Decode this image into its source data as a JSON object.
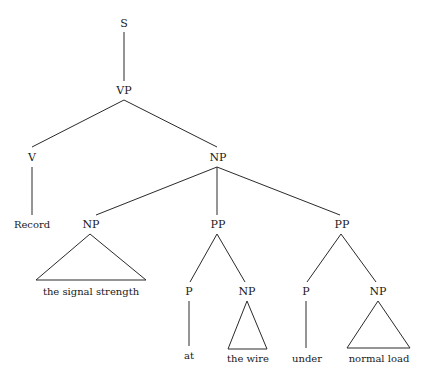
{
  "diagram": {
    "type": "parse-tree",
    "nodes": {
      "s": "S",
      "vp": "VP",
      "v": "V",
      "np_obj": "NP",
      "np_1": "NP",
      "pp_1": "PP",
      "pp_2": "PP",
      "p_1": "P",
      "np_2": "NP",
      "p_2": "P",
      "np_3": "NP"
    },
    "leaves": {
      "record": "Record",
      "signal_strength": "the signal strength",
      "at": "at",
      "the_wire": "the wire",
      "under": "under",
      "normal_load": "normal load"
    },
    "edges": [
      [
        "S",
        "VP"
      ],
      [
        "VP",
        "V"
      ],
      [
        "VP",
        "NP"
      ],
      [
        "V",
        "Record"
      ],
      [
        "NP",
        "NP"
      ],
      [
        "NP",
        "PP"
      ],
      [
        "NP",
        "PP"
      ],
      [
        "NP",
        "the signal strength (triangle)"
      ],
      [
        "PP",
        "P"
      ],
      [
        "PP",
        "NP"
      ],
      [
        "P",
        "at"
      ],
      [
        "NP",
        "the wire (triangle)"
      ],
      [
        "PP",
        "P"
      ],
      [
        "PP",
        "NP"
      ],
      [
        "P",
        "under"
      ],
      [
        "NP",
        "normal load (triangle)"
      ]
    ]
  }
}
